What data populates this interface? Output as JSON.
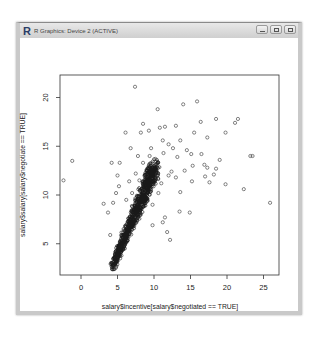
{
  "window": {
    "title": "R Graphics: Device 2 (ACTIVE)",
    "logo": "R",
    "controls": [
      "minimize-icon",
      "maximize-icon",
      "close-icon"
    ]
  },
  "chart_data": {
    "type": "scatter",
    "title": "",
    "xlabel": "salary$incentive[salary$negotiated == TRUE]",
    "ylabel": "salary$salary[salary$negotiate == TRUE]",
    "xticks": [
      0,
      5,
      10,
      15,
      20,
      25
    ],
    "yticks": [
      5,
      10,
      15,
      20
    ],
    "xlim": [
      -2.8,
      27
    ],
    "ylim": [
      2,
      22.6
    ],
    "grid": false,
    "legend": null,
    "marker": "open-circle",
    "points": [
      [
        7.4,
        21.1
      ],
      [
        -1.2,
        13.5
      ],
      [
        -2.4,
        11.5
      ],
      [
        8.5,
        17.3
      ],
      [
        8.2,
        16.4
      ],
      [
        9.3,
        16.6
      ],
      [
        10.5,
        18.8
      ],
      [
        11.5,
        17.0
      ],
      [
        14.0,
        19.3
      ],
      [
        15.9,
        19.6
      ],
      [
        16.4,
        17.5
      ],
      [
        18.5,
        17.8
      ],
      [
        21.1,
        17.4
      ],
      [
        21.5,
        17.8
      ],
      [
        19.8,
        16.4
      ],
      [
        23.2,
        14.0
      ],
      [
        23.5,
        14.0
      ],
      [
        25.9,
        9.2
      ],
      [
        22.3,
        10.6
      ],
      [
        19.8,
        11.1
      ],
      [
        17.6,
        11.3
      ],
      [
        17.0,
        11.9
      ],
      [
        15.2,
        11.4
      ],
      [
        12.4,
        12.4
      ],
      [
        13.6,
        10.3
      ],
      [
        14.9,
        8.2
      ],
      [
        11.5,
        7.7
      ],
      [
        11.8,
        6.2
      ],
      [
        5.3,
        13.3
      ],
      [
        5.0,
        12.0
      ],
      [
        4.2,
        13.3
      ],
      [
        4.8,
        10.2
      ],
      [
        5.2,
        10.9
      ],
      [
        6.6,
        11.4
      ],
      [
        7.5,
        12.2
      ],
      [
        8.5,
        13.3
      ],
      [
        9.4,
        14.0
      ],
      [
        9.6,
        14.8
      ],
      [
        10.2,
        13.7
      ],
      [
        11.3,
        14.3
      ],
      [
        11.2,
        15.6
      ],
      [
        12.0,
        15.2
      ],
      [
        12.6,
        14.8
      ],
      [
        13.2,
        13.9
      ],
      [
        13.6,
        15.6
      ],
      [
        14.5,
        14.6
      ],
      [
        15.1,
        14.2
      ],
      [
        15.3,
        13.0
      ],
      [
        16.5,
        14.2
      ],
      [
        16.9,
        13.1
      ],
      [
        17.3,
        12.8
      ],
      [
        18.2,
        12.1
      ],
      [
        18.5,
        12.7
      ],
      [
        19.0,
        13.6
      ],
      [
        3.7,
        8.2
      ],
      [
        4.4,
        9.2
      ],
      [
        3.1,
        9.1
      ],
      [
        6.2,
        9.5
      ],
      [
        7.0,
        10.2
      ],
      [
        12.0,
        12.0
      ],
      [
        11.0,
        11.2
      ],
      [
        13.0,
        11.8
      ],
      [
        14.2,
        12.5
      ],
      [
        10.6,
        10.2
      ],
      [
        9.8,
        9.0
      ],
      [
        13.5,
        8.3
      ],
      [
        8.6,
        10.4
      ],
      [
        11.2,
        7.2
      ],
      [
        4.0,
        5.9
      ],
      [
        9.8,
        6.9
      ],
      [
        12.2,
        5.4
      ],
      [
        6.1,
        16.4
      ],
      [
        6.8,
        14.8
      ],
      [
        7.8,
        14.0
      ],
      [
        10.8,
        16.9
      ],
      [
        13.0,
        17.1
      ],
      [
        15.5,
        16.4
      ],
      [
        17.3,
        15.9
      ],
      [
        9.0,
        12.0
      ],
      [
        8.0,
        11.5
      ]
    ],
    "dense_band": {
      "from": [
        4.3,
        2.6
      ],
      "to": [
        10.2,
        13.0
      ],
      "width_units": 1.2,
      "count_approx": 1200
    }
  }
}
